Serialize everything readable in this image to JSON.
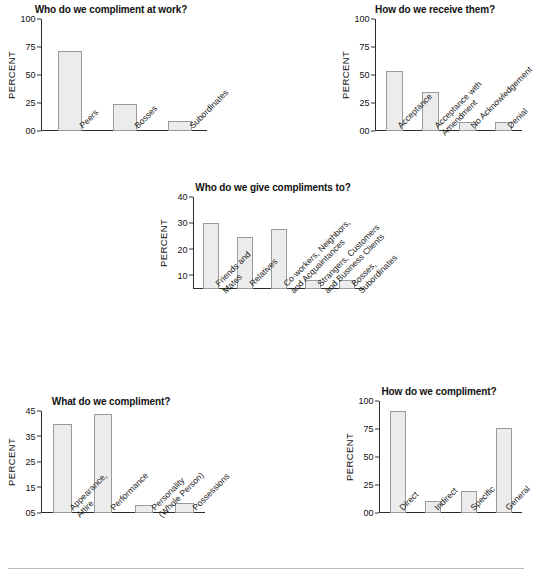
{
  "page": {
    "background_color": "#ffffff",
    "bar_fill_color": "#ececec",
    "bar_border_color": "#9a9a9a",
    "axis_color": "#2b2b2b",
    "rule_color": "#b9b9b9"
  },
  "chart_data": [
    {
      "id": "chart-compliment-at-work",
      "type": "bar",
      "title": "Who do we compliment at work?",
      "xlabel": "",
      "ylabel": "PERCENT",
      "ylim": [
        0,
        100
      ],
      "yticks": [
        0,
        25,
        50,
        75,
        100
      ],
      "ytick_labels": [
        "00",
        "25",
        "50",
        "75",
        "100"
      ],
      "grid": false,
      "legend": "none",
      "categories": [
        "Peers",
        "Bosses",
        "Subordinates"
      ],
      "category_lines": [
        [
          "Peers"
        ],
        [
          "Bosses"
        ],
        [
          "Subordinates"
        ]
      ],
      "values": [
        71,
        24,
        8.5
      ]
    },
    {
      "id": "chart-how-receive",
      "type": "bar",
      "title": "How do we receive them?",
      "xlabel": "",
      "ylabel": "PERCENT",
      "ylim": [
        0,
        100
      ],
      "yticks": [
        0,
        25,
        50,
        75,
        100
      ],
      "ytick_labels": [
        "00",
        "25",
        "50",
        "75",
        "100"
      ],
      "grid": false,
      "legend": "none",
      "categories": [
        "Acceptance",
        "Acceptance with Amendment",
        "No Acknowledgement",
        "Denial"
      ],
      "category_lines": [
        [
          "Acceptance"
        ],
        [
          "Acceptance with",
          "Amendment"
        ],
        [
          "No Acknowledgement"
        ],
        [
          "Denial"
        ]
      ],
      "values": [
        54,
        34.5,
        8,
        8
      ]
    },
    {
      "id": "chart-give-compliments-to",
      "type": "bar",
      "title": "Who do we give compliments to?",
      "xlabel": "",
      "ylabel": "PERCENT",
      "ylim": [
        5,
        40
      ],
      "yticks": [
        10,
        20,
        30,
        40
      ],
      "ytick_labels": [
        "10",
        "20",
        "30",
        "40"
      ],
      "grid": false,
      "legend": "none",
      "categories": [
        "Friends and Mates",
        "Relatives",
        "Co-workers, Neighbors, and Acquaintances",
        "Strangers, Customers and Business Clients",
        "Bosses, Subordinates"
      ],
      "category_lines": [
        [
          "Friends and",
          "Mates"
        ],
        [
          "Relatives"
        ],
        [
          "Co-workers, Neighbors,",
          "and Acquaintances"
        ],
        [
          "Strangers, Customers",
          "and Business Clients"
        ],
        [
          "Bosses,",
          "Subordinates"
        ]
      ],
      "values": [
        30,
        24.7,
        28,
        8.5,
        8.5
      ]
    },
    {
      "id": "chart-what-do-we-compliment",
      "type": "bar",
      "title": "What do we compliment?",
      "xlabel": "",
      "ylabel": "PERCENT",
      "ylim": [
        5,
        45
      ],
      "yticks": [
        5,
        15,
        25,
        35,
        45
      ],
      "ytick_labels": [
        "05",
        "15",
        "25",
        "35",
        "45"
      ],
      "grid": false,
      "legend": "none",
      "categories": [
        "Appearance, Attire",
        "Performance",
        "Personality (Whole Person)",
        "Possessions"
      ],
      "category_lines": [
        [
          "Appearance,",
          "Attire"
        ],
        [
          "Performance"
        ],
        [
          "Personality",
          "(Whole Person)"
        ],
        [
          "Possessions"
        ]
      ],
      "values": [
        40,
        44,
        8,
        9
      ]
    },
    {
      "id": "chart-how-do-we-compliment",
      "type": "bar",
      "title": "How do we compliment?",
      "xlabel": "",
      "ylabel": "PERCENT",
      "ylim": [
        0,
        100
      ],
      "yticks": [
        0,
        25,
        50,
        75,
        100
      ],
      "ytick_labels": [
        "00",
        "25",
        "50",
        "75",
        "100"
      ],
      "grid": false,
      "legend": "none",
      "categories": [
        "Direct",
        "Indirect",
        "Specific",
        "General"
      ],
      "category_lines": [
        [
          "Direct"
        ],
        [
          "Indirect"
        ],
        [
          "Specific"
        ],
        [
          "General"
        ]
      ],
      "values": [
        91,
        11,
        20,
        76
      ]
    }
  ]
}
